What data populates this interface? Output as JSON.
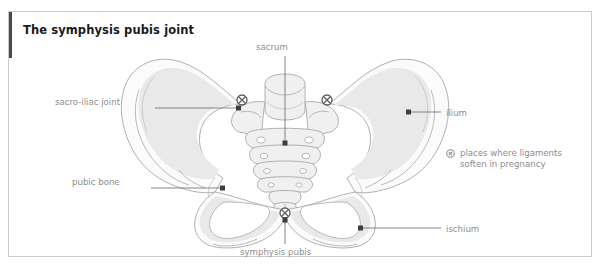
{
  "figure": {
    "title": "The symphysis pubis joint",
    "accent_color": "#4a4a4a",
    "border_color": "#c9c9c9",
    "background": "#ffffff",
    "label_color": "#8d8d8d",
    "leader_color": "#6f6f6f",
    "bone_fill": "#f4f4f4",
    "bone_stroke": "#9a9a9a",
    "bone_shade": "#e8e8e8"
  },
  "labels": {
    "sacrum": "sacrum",
    "sacroiliac_joint": "sacro-iliac joint",
    "pubic_bone": "pubic bone",
    "symphysis_pubis": "symphysis pubis",
    "ilium": "ilium",
    "ischium": "ischium"
  },
  "legend": {
    "icon": "circled-x-icon",
    "text": "places where ligaments\nsoften in pregnancy"
  },
  "ligament_markers": [
    {
      "name": "left-sacro-iliac-ligament-marker",
      "x": 233,
      "y": 88
    },
    {
      "name": "right-sacro-iliac-ligament-marker",
      "x": 318,
      "y": 88
    },
    {
      "name": "symphysis-pubis-ligament-marker",
      "x": 276,
      "y": 201
    }
  ]
}
